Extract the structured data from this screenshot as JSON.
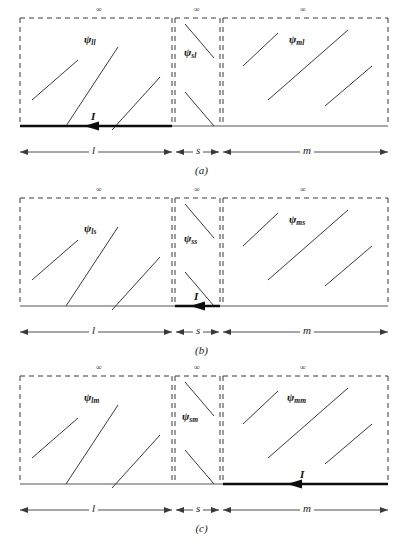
{
  "figure": {
    "type": "schematic",
    "panel_count": 3,
    "region_labels": [
      "l",
      "s",
      "m"
    ],
    "infinity_symbol": "∞",
    "current_label": "I",
    "geometry": {
      "box_left_x": 20,
      "box_div1_x": 172,
      "box_div2_x": 223,
      "box_right_x": 388,
      "box_top_y": 18,
      "box_bottom_y": 126,
      "dim_line_y": 152,
      "caption_y": 163
    },
    "colors": {
      "stroke": "#3a3a3a",
      "bold_stroke": "#0d0d0d",
      "text": "#1a1a1a",
      "background": "#ffffff"
    }
  },
  "panels": [
    {
      "id": "a",
      "caption": "(a)",
      "active_region": "l",
      "infinity_labels": [
        "∞",
        "∞",
        "∞"
      ],
      "regions": [
        {
          "key": "l",
          "psi": "ψ",
          "sub": "ll",
          "hatch": "up",
          "hatch_count": 3
        },
        {
          "key": "s",
          "psi": "ψ",
          "sub": "sl",
          "hatch": "down",
          "hatch_count": 2
        },
        {
          "key": "m",
          "psi": "ψ",
          "sub": "ml",
          "hatch": "up",
          "hatch_count": 3
        }
      ],
      "current": {
        "label": "I",
        "direction": "left",
        "region": "l"
      },
      "dimensions": [
        {
          "label": "l"
        },
        {
          "label": "s"
        },
        {
          "label": "m"
        }
      ]
    },
    {
      "id": "b",
      "caption": "(b)",
      "active_region": "s",
      "infinity_labels": [
        "∞",
        "∞",
        "∞"
      ],
      "regions": [
        {
          "key": "l",
          "psi": "ψ",
          "sub": "ls",
          "hatch": "up",
          "hatch_count": 3
        },
        {
          "key": "s",
          "psi": "ψ",
          "sub": "ss",
          "hatch": "down",
          "hatch_count": 2
        },
        {
          "key": "m",
          "psi": "ψ",
          "sub": "ms",
          "hatch": "up",
          "hatch_count": 3
        }
      ],
      "current": {
        "label": "I",
        "direction": "left",
        "region": "s"
      },
      "dimensions": [
        {
          "label": "l"
        },
        {
          "label": "s"
        },
        {
          "label": "m"
        }
      ]
    },
    {
      "id": "c",
      "caption": "(c)",
      "active_region": "m",
      "infinity_labels": [
        "∞",
        "∞",
        "∞"
      ],
      "regions": [
        {
          "key": "l",
          "psi": "ψ",
          "sub": "lm",
          "hatch": "up",
          "hatch_count": 3
        },
        {
          "key": "s",
          "psi": "ψ",
          "sub": "sm",
          "hatch": "down",
          "hatch_count": 2
        },
        {
          "key": "m",
          "psi": "ψ",
          "sub": "mm",
          "hatch": "up",
          "hatch_count": 3
        }
      ],
      "current": {
        "label": "I",
        "direction": "left",
        "region": "m"
      },
      "dimensions": [
        {
          "label": "l"
        },
        {
          "label": "s"
        },
        {
          "label": "m"
        }
      ]
    }
  ]
}
